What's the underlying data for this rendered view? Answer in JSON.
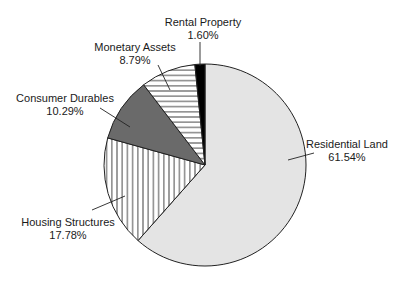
{
  "chart_data": {
    "type": "pie",
    "title": "",
    "start_angle_deg": 0,
    "direction": "clockwise",
    "center": [
      205,
      165
    ],
    "radius": 101,
    "slices": [
      {
        "label": "Residential Land",
        "value": 61.54,
        "value_label": "61.54%",
        "fill": "light-gray",
        "color": "#e4e4e4",
        "label_pos": [
          347,
          148
        ],
        "leader": [
          [
            288,
            160
          ],
          [
            314,
            153
          ]
        ]
      },
      {
        "label": "Housing Structures",
        "value": 17.78,
        "value_label": "17.78%",
        "fill": "vertical-hatch",
        "color": "#ffffff",
        "label_pos": [
          68,
          226
        ],
        "leader": [
          [
            92,
            210
          ],
          [
            125,
            196
          ]
        ]
      },
      {
        "label": "Consumer Durables",
        "value": 10.29,
        "value_label": "10.29%",
        "fill": "dark-gray",
        "color": "#6a6a6a",
        "label_pos": [
          65,
          102
        ],
        "leader": [
          [
            100,
            108
          ],
          [
            130,
            127
          ]
        ]
      },
      {
        "label": "Monetary Assets",
        "value": 8.79,
        "value_label": "8.79%",
        "fill": "horizontal-hatch",
        "color": "#ffffff",
        "label_pos": [
          135,
          51
        ],
        "leader": [
          [
            158,
            65
          ],
          [
            170,
            90
          ]
        ]
      },
      {
        "label": "Rental Property",
        "value": 1.6,
        "value_label": "1.60%",
        "fill": "black",
        "color": "#000000",
        "label_pos": [
          203,
          26
        ],
        "leader": [
          [
            200,
            42
          ],
          [
            200,
            66
          ]
        ]
      }
    ],
    "legend": "none",
    "labels": "outside with leader lines"
  }
}
